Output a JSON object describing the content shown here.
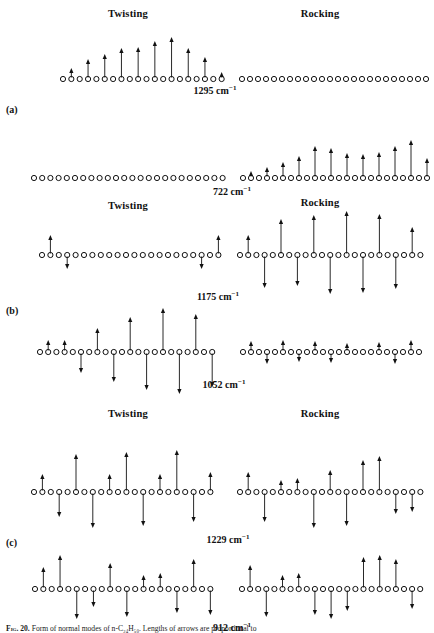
{
  "figure": {
    "caption_prefix": "Fig. 20.",
    "caption_text": "Form of normal modes of n-C₂₄H₅₀. Lengths of arrows are proportional to",
    "panels": [
      {
        "tag": "(a)",
        "tag_x": 6,
        "tag_y": 104,
        "rows": [
          {
            "id": "a1",
            "baseline_y": 79,
            "freq": "1295",
            "freq_unit": "cm",
            "freq_sup": "−1",
            "freq_x": 215,
            "freq_y": 84,
            "labels": [
              {
                "text": "Twisting",
                "x": 128,
                "y": 8
              },
              {
                "text": "Rocking",
                "x": 320,
                "y": 8
              }
            ],
            "groups": [
              {
                "name": "twisting",
                "x_start": 63,
                "spacing": 8.35,
                "count": 20,
                "amplitudes": [
                  0,
                  11,
                  0,
                  20,
                  0,
                  25,
                  0,
                  31,
                  0,
                  32,
                  0,
                  38,
                  0,
                  42,
                  0,
                  31,
                  0,
                  22,
                  0,
                  7
                ]
              },
              {
                "name": "rocking",
                "x_start": 242,
                "spacing": 8.0,
                "count": 24,
                "amplitudes": [
                  0,
                  0,
                  0,
                  0,
                  0,
                  0,
                  0,
                  0,
                  0,
                  0,
                  0,
                  0,
                  0,
                  0,
                  0,
                  0,
                  0,
                  0,
                  0,
                  0,
                  0,
                  0,
                  0,
                  0
                ]
              }
            ]
          },
          {
            "id": "a2",
            "baseline_y": 178,
            "freq": "722",
            "freq_unit": "cm",
            "freq_sup": "−1",
            "freq_x": 232,
            "freq_y": 185,
            "labels": [],
            "groups": [
              {
                "name": "twisting",
                "x_start": 34,
                "spacing": 8.2,
                "count": 24,
                "amplitudes": [
                  0,
                  0,
                  0,
                  0,
                  0,
                  0,
                  0,
                  0,
                  0,
                  0,
                  0,
                  0,
                  0,
                  0,
                  0,
                  0,
                  0,
                  0,
                  0,
                  0,
                  0,
                  0,
                  0,
                  0
                ]
              },
              {
                "name": "rocking",
                "x_start": 243,
                "spacing": 8.0,
                "count": 24,
                "amplitudes": [
                  0,
                  7,
                  0,
                  11,
                  0,
                  16,
                  0,
                  22,
                  0,
                  32,
                  0,
                  30,
                  0,
                  25,
                  0,
                  24,
                  0,
                  26,
                  0,
                  32,
                  0,
                  38,
                  0,
                  20
                ]
              }
            ]
          }
        ]
      },
      {
        "tag": "(b)",
        "tag_x": 6,
        "tag_y": 305,
        "rows": [
          {
            "id": "b1",
            "baseline_y": 255,
            "freq": "1175",
            "freq_unit": "cm",
            "freq_sup": "−1",
            "freq_x": 218,
            "freq_y": 290,
            "labels": [
              {
                "text": "Twisting",
                "x": 128,
                "y": 200
              },
              {
                "text": "Rocking",
                "x": 320,
                "y": 197
              }
            ],
            "groups": [
              {
                "name": "twisting",
                "x_start": 42,
                "spacing": 8.4,
                "count": 22,
                "amplitudes": [
                  0,
                  20,
                  0,
                  -14,
                  0,
                  0,
                  0,
                  0,
                  0,
                  0,
                  0,
                  0,
                  0,
                  0,
                  0,
                  0,
                  0,
                  0,
                  0,
                  -14,
                  0,
                  20
                ]
              },
              {
                "name": "rocking",
                "x_start": 240,
                "spacing": 8.2,
                "count": 23,
                "amplitudes": [
                  0,
                  20,
                  0,
                  -33,
                  0,
                  36,
                  0,
                  -31,
                  0,
                  40,
                  0,
                  -39,
                  0,
                  44,
                  0,
                  -38,
                  0,
                  41,
                  0,
                  -34,
                  0,
                  28,
                  0
                ]
              }
            ]
          },
          {
            "id": "b2",
            "baseline_y": 352,
            "freq": "1052",
            "freq_unit": "cm",
            "freq_sup": "−1",
            "freq_x": 224,
            "freq_y": 378,
            "labels": [],
            "groups": [
              {
                "name": "twisting",
                "x_start": 40,
                "spacing": 8.2,
                "count": 22,
                "amplitudes": [
                  0,
                  12,
                  0,
                  12,
                  0,
                  -21,
                  0,
                  24,
                  0,
                  -30,
                  0,
                  35,
                  0,
                  -38,
                  0,
                  44,
                  0,
                  -42,
                  0,
                  38,
                  0,
                  -35
                ]
              },
              {
                "name": "rocking",
                "x_start": 243,
                "spacing": 8.0,
                "count": 23,
                "amplitudes": [
                  0,
                  11,
                  0,
                  -12,
                  0,
                  12,
                  0,
                  -10,
                  0,
                  11,
                  0,
                  -11,
                  0,
                  9,
                  0,
                  0,
                  0,
                  10,
                  0,
                  -12,
                  0,
                  12,
                  0
                ]
              }
            ]
          }
        ]
      },
      {
        "tag": "(c)",
        "tag_x": 6,
        "tag_y": 537,
        "rows": [
          {
            "id": "c1",
            "baseline_y": 492,
            "freq": "1229",
            "freq_unit": "cm",
            "freq_sup": "−1",
            "freq_x": 228,
            "freq_y": 533,
            "labels": [
              {
                "text": "Twisting",
                "x": 128,
                "y": 408
              },
              {
                "text": "Rocking",
                "x": 320,
                "y": 408
              }
            ],
            "groups": [
              {
                "name": "twisting",
                "x_start": 34,
                "spacing": 8.4,
                "count": 22,
                "amplitudes": [
                  0,
                  18,
                  0,
                  -25,
                  0,
                  38,
                  0,
                  -36,
                  0,
                  18,
                  0,
                  40,
                  0,
                  -34,
                  0,
                  18,
                  0,
                  42,
                  0,
                  -30,
                  0,
                  20
                ]
              },
              {
                "name": "rocking",
                "x_start": 240,
                "spacing": 8.2,
                "count": 23,
                "amplitudes": [
                  0,
                  20,
                  0,
                  -30,
                  0,
                  12,
                  0,
                  14,
                  0,
                  -36,
                  0,
                  22,
                  0,
                  -34,
                  0,
                  32,
                  0,
                  36,
                  0,
                  -22,
                  0,
                  -20,
                  0
                ]
              }
            ]
          },
          {
            "id": "c2",
            "baseline_y": 589,
            "freq": "912",
            "freq_unit": "cm",
            "freq_sup": "−1",
            "freq_x": 232,
            "freq_y": 621,
            "labels": [],
            "groups": [
              {
                "name": "twisting",
                "x_start": 35,
                "spacing": 8.35,
                "count": 22,
                "amplitudes": [
                  0,
                  22,
                  0,
                  34,
                  0,
                  -30,
                  0,
                  -18,
                  0,
                  26,
                  0,
                  -28,
                  0,
                  14,
                  0,
                  16,
                  0,
                  -24,
                  0,
                  30,
                  0,
                  -26
                ]
              },
              {
                "name": "rocking",
                "x_start": 242,
                "spacing": 8.1,
                "count": 23,
                "amplitudes": [
                  0,
                  24,
                  0,
                  -28,
                  0,
                  14,
                  0,
                  16,
                  0,
                  -26,
                  0,
                  -30,
                  0,
                  -22,
                  0,
                  32,
                  0,
                  34,
                  0,
                  30,
                  0,
                  -20,
                  0
                ]
              }
            ]
          }
        ]
      }
    ],
    "style": {
      "circle_radius": 2.6,
      "circle_stroke": "#111111",
      "arrow_color": "#111111",
      "background": "#ffffff"
    }
  }
}
